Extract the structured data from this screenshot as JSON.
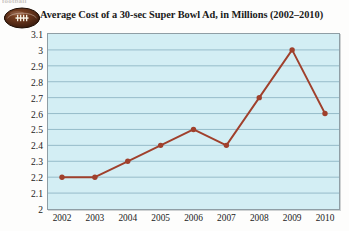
{
  "clipped_header_text": "football",
  "header": {
    "icon": "football-icon",
    "title": "Average Cost of a 30-sec Super Bowl Ad, in Millions (2002–2010)"
  },
  "colors": {
    "plot_background": "#d3eef4",
    "plot_border": "#8f9ea5",
    "gridline": "#8fb6c4",
    "series_line": "#a0402c",
    "marker_fill": "#a0402c",
    "text": "#1b1b1b",
    "football_body": "#5c2f19",
    "football_laces": "#f2efe6"
  },
  "chart_data": {
    "type": "line",
    "title": "Average Cost of a 30-sec Super Bowl Ad, in Millions (2002–2010)",
    "xlabel": "",
    "ylabel": "",
    "categories": [
      "2002",
      "2003",
      "2004",
      "2005",
      "2006",
      "2007",
      "2008",
      "2009",
      "2010"
    ],
    "values": [
      2.2,
      2.2,
      2.3,
      2.4,
      2.5,
      2.4,
      2.7,
      3.0,
      2.6
    ],
    "series": [
      {
        "name": "Average Cost (Millions USD)",
        "values": [
          2.2,
          2.2,
          2.3,
          2.4,
          2.5,
          2.4,
          2.7,
          3.0,
          2.6
        ]
      }
    ],
    "ylim": [
      2,
      3.1
    ],
    "ytick_step": 0.1,
    "yticks": [
      "3.1",
      "3",
      "2.9",
      "2.8",
      "2.7",
      "2.6",
      "2.5",
      "2.4",
      "2.3",
      "2.2",
      "2.1",
      "2"
    ],
    "xticks": [
      "2002",
      "2003",
      "2004",
      "2005",
      "2006",
      "2007",
      "2008",
      "2009",
      "2010"
    ],
    "grid": "horizontal",
    "legend": "none",
    "markers": "circle"
  }
}
